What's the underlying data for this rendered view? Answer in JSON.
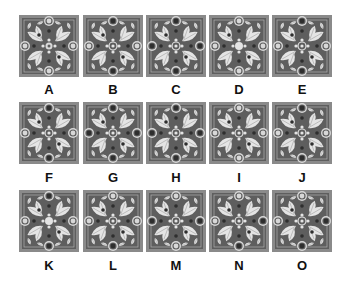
{
  "colors": {
    "frame": "#8a8a8a",
    "ground": "#5e5e5e",
    "inner_line": "#b0b0b0",
    "leaf": "#e4e4e4",
    "leaf_vein": "#9a9a9a",
    "dark_dot": "#2e2e2e",
    "ring": "#d8d8d8",
    "label": "#111111"
  },
  "tiles": [
    {
      "label": "A",
      "edge": [
        "light",
        "light",
        "light",
        "light"
      ],
      "center": "light"
    },
    {
      "label": "B",
      "edge": [
        "dark",
        "dark",
        "light",
        "light"
      ],
      "center": "ring"
    },
    {
      "label": "C",
      "edge": [
        "dark",
        "dark",
        "dark",
        "dark"
      ],
      "center": "ring"
    },
    {
      "label": "D",
      "edge": [
        "light",
        "light",
        "light",
        "light"
      ],
      "center": "solid"
    },
    {
      "label": "E",
      "edge": [
        "dark",
        "dark",
        "light",
        "light"
      ],
      "center": "ring"
    },
    {
      "label": "F",
      "edge": [
        "dark",
        "dark",
        "light",
        "light"
      ],
      "center": "ring"
    },
    {
      "label": "G",
      "edge": [
        "dark",
        "dark",
        "dark",
        "dark"
      ],
      "center": "ring"
    },
    {
      "label": "H",
      "edge": [
        "dark",
        "dark",
        "dark",
        "dark"
      ],
      "center": "ring"
    },
    {
      "label": "I",
      "edge": [
        "light",
        "light",
        "light",
        "light"
      ],
      "center": "ring"
    },
    {
      "label": "J",
      "edge": [
        "dark",
        "dark",
        "light",
        "light"
      ],
      "center": "ring"
    },
    {
      "label": "K",
      "edge": [
        "dark",
        "dark",
        "light",
        "light"
      ],
      "center": "solid"
    },
    {
      "label": "L",
      "edge": [
        "light",
        "dark",
        "light",
        "light"
      ],
      "center": "ring"
    },
    {
      "label": "M",
      "edge": [
        "light",
        "light",
        "dark",
        "dark"
      ],
      "center": "ring"
    },
    {
      "label": "N",
      "edge": [
        "light",
        "dark",
        "light",
        "dark"
      ],
      "center": "ring"
    },
    {
      "label": "O",
      "edge": [
        "light",
        "dark",
        "light",
        "dark"
      ],
      "center": "ring"
    }
  ]
}
